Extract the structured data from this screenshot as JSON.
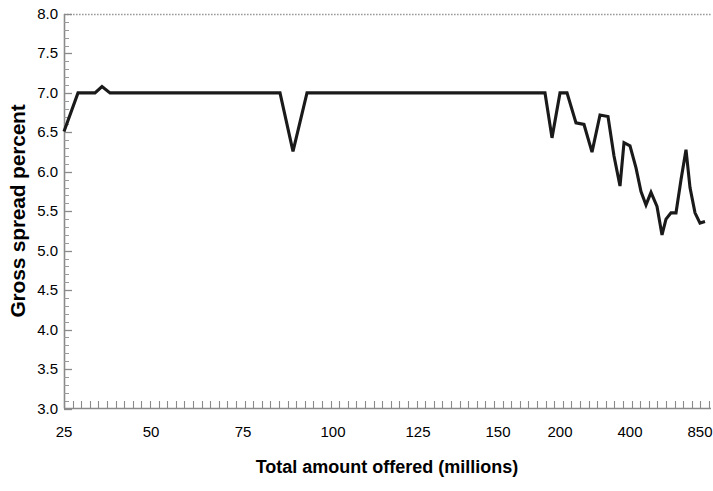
{
  "chart_data": {
    "type": "line",
    "title": "",
    "xlabel": "Total amount offered (millions)",
    "ylabel": "Gross spread percent",
    "ylim": [
      3.0,
      8.0
    ],
    "y_ticks": [
      "3.0",
      "3.5",
      "4.0",
      "4.5",
      "5.0",
      "5.5",
      "6.0",
      "6.5",
      "7.0",
      "7.5",
      "8.0"
    ],
    "y_tick_values": [
      3.0,
      3.5,
      4.0,
      4.5,
      5.0,
      5.5,
      6.0,
      6.5,
      7.0,
      7.5,
      8.0
    ],
    "x_ticks": [
      "25",
      "50",
      "75",
      "100",
      "125",
      "150",
      "200",
      "400",
      "850"
    ],
    "x_tick_positions_px": [
      64,
      151,
      243,
      333,
      418,
      498,
      560,
      630,
      700
    ],
    "grid": false,
    "legend": null,
    "line_color": "#1a1a1a",
    "frame_color": "#808080",
    "series": [
      {
        "name": "Gross spread percent",
        "x_px": [
          64,
          78,
          95,
          102,
          110,
          147,
          280,
          293,
          307,
          313,
          545,
          552,
          560,
          567,
          576,
          584,
          592,
          600,
          608,
          614,
          620,
          624,
          630,
          636,
          641,
          646,
          651,
          657,
          662,
          666,
          671,
          676,
          681,
          686,
          690,
          695,
          700,
          705
        ],
        "values": [
          6.51,
          7.0,
          7.0,
          7.08,
          7.0,
          7.0,
          7.0,
          6.26,
          7.0,
          7.0,
          7.0,
          6.43,
          7.0,
          7.0,
          6.62,
          6.6,
          6.25,
          6.72,
          6.7,
          6.2,
          5.82,
          6.37,
          6.33,
          6.05,
          5.75,
          5.58,
          5.74,
          5.56,
          5.2,
          5.4,
          5.48,
          5.48,
          5.9,
          6.28,
          5.8,
          5.48,
          5.35,
          5.37
        ]
      }
    ]
  },
  "axis": {
    "y_title": "Gross spread percent",
    "x_title": "Total amount offered (millions)"
  }
}
